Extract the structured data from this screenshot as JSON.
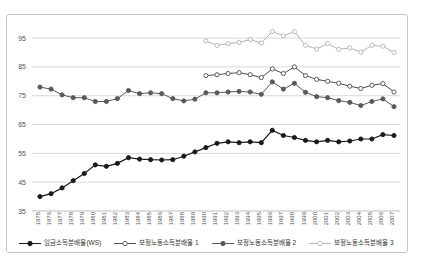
{
  "chart_data": {
    "type": "line",
    "title": "",
    "xlabel": "",
    "ylabel": "",
    "x_first": 1975,
    "x_last": 2007,
    "x_tick_labels": [
      "1975",
      "1976",
      "1977",
      "1978",
      "1979",
      "1980",
      "1981",
      "1982",
      "1983",
      "1984",
      "1985",
      "1986",
      "1987",
      "1988",
      "1989",
      "1990",
      "1991",
      "1992",
      "1993",
      "1994",
      "1995",
      "1996",
      "1997",
      "1998",
      "1999",
      "2000",
      "2001",
      "2002",
      "2003",
      "2004",
      "2005",
      "2006",
      "2007"
    ],
    "yticks": [
      35,
      45,
      55,
      65,
      75,
      85,
      95
    ],
    "ylim": [
      35,
      98.5
    ],
    "grid": "horizontal",
    "legend_position": "bottom",
    "grid_color": "#d9d9d9",
    "baseline_color": "#bdbdbd",
    "tick_label_color": "#555555",
    "frame_border_color": "#c6c6c6",
    "series": [
      {
        "name": "임금소득분배율(WS)",
        "marker": "filled-circle",
        "color": "#1a1a1a",
        "start_year": 1975,
        "values": [
          40,
          41,
          43,
          45.5,
          48,
          51,
          50.5,
          51.5,
          53.5,
          53,
          52.8,
          52.7,
          52.8,
          54,
          55.5,
          57,
          58.5,
          59,
          58.7,
          59,
          58.7,
          63,
          61.2,
          60.5,
          59.5,
          59,
          59.5,
          59,
          59.3,
          60,
          60,
          61.5,
          61.2
        ]
      },
      {
        "name": "보정노동소득분배율 1",
        "marker": "open-circle",
        "color": "#4d4d4d",
        "start_year": 1990,
        "values": [
          82,
          82.3,
          82.7,
          83,
          82.3,
          81.3,
          84.3,
          82.7,
          85,
          82,
          80.7,
          80,
          79.3,
          78.3,
          77.5,
          78.6,
          79.2,
          76.3
        ]
      },
      {
        "name": "보정노동소득분배율 2",
        "marker": "filled-circle",
        "color": "#595959",
        "start_year": 1975,
        "values": [
          78,
          77.3,
          75.3,
          74.3,
          74.3,
          73,
          73,
          74,
          76.8,
          75.7,
          76,
          75.7,
          74,
          73.2,
          73.8,
          76,
          76,
          76.3,
          76.5,
          76.3,
          75.5,
          79.8,
          77.3,
          79.3,
          76.2,
          74.7,
          74.3,
          73.3,
          72.7,
          71.6,
          73,
          73.9,
          71.2
        ]
      },
      {
        "name": "보정노동소득분배율 3",
        "marker": "open-circle",
        "color": "#b3b3b3",
        "start_year": 1990,
        "values": [
          94,
          92.5,
          93.1,
          93.5,
          94.5,
          93.3,
          97.3,
          95.8,
          97.2,
          92.5,
          91.2,
          93.1,
          91.1,
          91.6,
          90.1,
          92.5,
          92.2,
          90
        ]
      }
    ]
  }
}
